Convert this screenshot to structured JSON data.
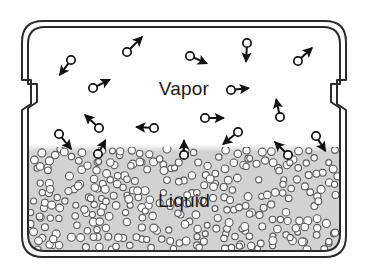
{
  "figure": {
    "title_vapor": "Vapor",
    "title_liquid": "Liquid",
    "canvas": {
      "width": 368,
      "height": 272
    },
    "background_color": "#ffffff"
  },
  "container": {
    "name": "sealed-vessel",
    "outer_wall_color": "#2b2b2b",
    "inner_wall_color": "#2b2b2b",
    "wall_stroke_width": 2,
    "outer_path": "M 22 42 Q 22 21 43 21 L 325 21 Q 346 21 346 42 L 346 80 L 337 80 L 337 104 L 346 110 L 346 236 Q 346 257 325 257 L 43 257 Q 22 257 22 236 L 22 110 L 31 104 L 31 80 L 22 80 Z",
    "inner_path": "M 28 44 Q 28 27 45 27 L 323 27 Q 340 27 340 44 L 340 84 L 331 84 L 331 102 L 340 108 L 340 234 Q 340 251 323 251 L 45 251 Q 28 251 28 234 L 28 108 L 37 102 L 37 84 L 28 84 Z",
    "notch_left": {
      "x": 22,
      "y": 80,
      "width": 9,
      "height": 30
    },
    "notch_right": {
      "x": 337,
      "y": 80,
      "width": 9,
      "height": 30
    }
  },
  "phases": {
    "vapor": {
      "label": "Vapor",
      "label_x": 184,
      "label_y": 95,
      "fill_color": "#ffffff",
      "region": {
        "x": 29,
        "y": 28,
        "width": 310,
        "height": 123
      }
    },
    "liquid": {
      "label": "Liquid",
      "label_x": 184,
      "label_y": 207,
      "fill_color": "#d2d2d2",
      "surface_y": 151,
      "region": {
        "x": 29,
        "y": 151,
        "width": 310,
        "height": 99
      },
      "particle_fill": "#ffffff",
      "particle_stroke": "#5a5a5a"
    }
  },
  "chart_data": {
    "type": "diagram",
    "vapor_molecules": [
      {
        "cx": 71,
        "cy": 60,
        "ax": 59,
        "ay": 76
      },
      {
        "cx": 127,
        "cy": 52,
        "ax": 143,
        "ay": 36
      },
      {
        "cx": 190,
        "cy": 56,
        "ax": 208,
        "ay": 64
      },
      {
        "cx": 247,
        "cy": 43,
        "ax": 246,
        "ay": 63
      },
      {
        "cx": 298,
        "cy": 61,
        "ax": 313,
        "ay": 47
      },
      {
        "cx": 93,
        "cy": 88,
        "ax": 111,
        "ay": 79
      },
      {
        "cx": 231,
        "cy": 90,
        "ax": 250,
        "ay": 88
      },
      {
        "cx": 280,
        "cy": 117,
        "ax": 276,
        "ay": 98
      },
      {
        "cx": 99,
        "cy": 128,
        "ax": 84,
        "ay": 114
      },
      {
        "cx": 154,
        "cy": 128,
        "ax": 135,
        "ay": 127
      },
      {
        "cx": 205,
        "cy": 118,
        "ax": 225,
        "ay": 118
      },
      {
        "cx": 238,
        "cy": 132,
        "ax": 222,
        "ay": 145
      },
      {
        "cx": 59,
        "cy": 134,
        "ax": 72,
        "ay": 150
      },
      {
        "cx": 316,
        "cy": 136,
        "ax": 326,
        "ay": 152
      },
      {
        "cx": 98,
        "cy": 154,
        "ax": 106,
        "ay": 139
      },
      {
        "cx": 184,
        "cy": 155,
        "ax": 184,
        "ay": 139
      },
      {
        "cx": 288,
        "cy": 155,
        "ax": 274,
        "ay": 141
      }
    ],
    "liquid_particle_count": 300,
    "liquid_particle_radius": 3.6,
    "legend": [
      "Vapor",
      "Liquid"
    ]
  }
}
